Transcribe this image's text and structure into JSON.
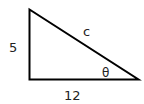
{
  "diagram": {
    "type": "right-triangle",
    "labels": {
      "vertical_side": "5",
      "horizontal_side": "12",
      "hypotenuse": "c",
      "angle": "θ"
    },
    "colors": {
      "stroke": "#000000",
      "text": "#222222",
      "background": "#ffffff"
    }
  }
}
